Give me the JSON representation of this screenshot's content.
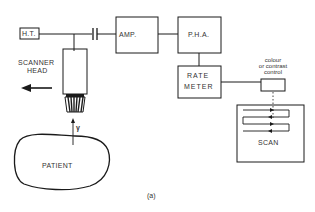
{
  "diagram": {
    "blocks": {
      "ht": "H.T.",
      "amp": "AMP.",
      "pha": "P.H.A.",
      "rate_meter_line1": "RATE",
      "rate_meter_line2": "METER",
      "scan": "SCAN"
    },
    "labels": {
      "scanner_head_line1": "SCANNER",
      "scanner_head_line2": "HEAD",
      "control_line1": "colour",
      "control_line2": "or contrast",
      "control_line3": "control",
      "gamma": "γ",
      "patient": "PATIENT",
      "figure": "(a)"
    },
    "colors": {
      "stroke": "#1a1a1a",
      "background": "#ffffff"
    }
  }
}
